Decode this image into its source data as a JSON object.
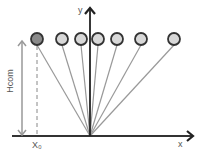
{
  "diagram": {
    "axes": {
      "x_label": "x",
      "y_label": "y"
    },
    "annotations": {
      "height_label": "Hcom",
      "x0_label": "X₀"
    },
    "pivot": {
      "x": 90,
      "y": 136
    },
    "ground_y": 136,
    "circles": [
      {
        "cx": 37,
        "cy": 39,
        "fill": "#8a8a8a",
        "highlighted": true
      },
      {
        "cx": 62,
        "cy": 39,
        "fill": "#d8d8d8"
      },
      {
        "cx": 81,
        "cy": 39,
        "fill": "#d8d8d8"
      },
      {
        "cx": 98,
        "cy": 39,
        "fill": "#d8d8d8"
      },
      {
        "cx": 117,
        "cy": 39,
        "fill": "#d8d8d8"
      },
      {
        "cx": 141,
        "cy": 39,
        "fill": "#d8d8d8"
      },
      {
        "cx": 174,
        "cy": 39,
        "fill": "#d8d8d8"
      }
    ]
  }
}
